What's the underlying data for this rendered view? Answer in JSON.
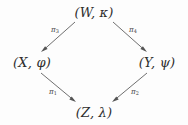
{
  "diagram": {
    "type": "commutative-diagram",
    "shape": "diamond",
    "canvas": {
      "width": 188,
      "height": 125
    },
    "background_color": "#fdfdfd",
    "stroke_color": "#555555",
    "text_color": "#2e2e2e",
    "nodes": [
      {
        "id": "W",
        "position": "top",
        "label": "(W, κ)",
        "object": "W",
        "structure": "κ",
        "x": 94,
        "y": 12
      },
      {
        "id": "X",
        "position": "left",
        "label": "(X, φ)",
        "object": "X",
        "structure": "φ",
        "x": 32,
        "y": 62
      },
      {
        "id": "Y",
        "position": "right",
        "label": "(Y, ψ)",
        "object": "Y",
        "structure": "ψ",
        "x": 157,
        "y": 62
      },
      {
        "id": "Z",
        "position": "bottom",
        "label": "(Z, λ)",
        "object": "Z",
        "structure": "λ",
        "x": 94,
        "y": 112
      }
    ],
    "arrows": [
      {
        "id": "arrow-w-x",
        "label": "π",
        "subscript": "3",
        "from": "W",
        "to": "X",
        "label_x": 55,
        "label_y": 30,
        "x1": 75,
        "y1": 22,
        "x2": 41,
        "y2": 52
      },
      {
        "id": "arrow-w-y",
        "label": "π",
        "subscript": "4",
        "from": "W",
        "to": "Y",
        "label_x": 133,
        "label_y": 30,
        "x1": 113,
        "y1": 22,
        "x2": 147,
        "y2": 52
      },
      {
        "id": "arrow-x-z",
        "label": "π",
        "subscript": "1",
        "from": "X",
        "to": "Z",
        "label_x": 53,
        "label_y": 92,
        "x1": 41,
        "y1": 73,
        "x2": 76,
        "y2": 102
      },
      {
        "id": "arrow-y-z",
        "label": "π",
        "subscript": "2",
        "from": "Y",
        "to": "Z",
        "label_x": 135,
        "label_y": 92,
        "x1": 147,
        "y1": 73,
        "x2": 112,
        "y2": 102
      }
    ]
  }
}
